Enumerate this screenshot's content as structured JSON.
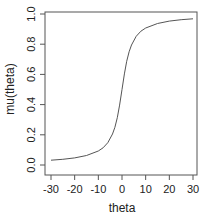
{
  "chart_data": {
    "type": "line",
    "title": "",
    "xlabel": "theta",
    "ylabel": "mu(theta)",
    "xlim": [
      -32,
      32
    ],
    "ylim": [
      -0.04,
      1.04
    ],
    "xticks": [
      -30,
      -20,
      -10,
      0,
      10,
      20,
      30
    ],
    "xtick_labels": [
      "-30",
      "-20",
      "-10",
      "0",
      "10",
      "20",
      "30"
    ],
    "yticks": [
      0.0,
      0.2,
      0.4,
      0.6,
      0.8,
      1.0
    ],
    "ytick_labels": [
      "0.0",
      "0.2",
      "0.4",
      "0.6",
      "0.8",
      "1.0"
    ],
    "grid": false,
    "legend": null,
    "series": [
      {
        "name": "mu(theta)",
        "color": "#555555",
        "x": [
          -30,
          -25,
          -20,
          -15,
          -10,
          -8,
          -6,
          -4,
          -3,
          -2,
          -1,
          0,
          1,
          2,
          3,
          4,
          6,
          8,
          10,
          15,
          20,
          25,
          30
        ],
        "y": [
          0.032,
          0.038,
          0.047,
          0.063,
          0.093,
          0.114,
          0.148,
          0.205,
          0.25,
          0.313,
          0.397,
          0.5,
          0.603,
          0.687,
          0.75,
          0.795,
          0.852,
          0.886,
          0.907,
          0.937,
          0.953,
          0.962,
          0.968
        ]
      }
    ]
  }
}
